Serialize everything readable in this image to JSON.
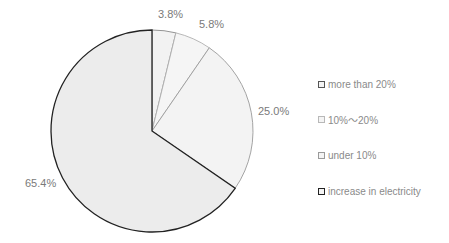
{
  "chart_data": {
    "type": "pie",
    "title": "",
    "start_angle": "12 o'clock",
    "direction": "clockwise",
    "categories": [
      "more than 20%",
      "10%~20%",
      "under 10%",
      "increase in electricity"
    ],
    "values": [
      3.8,
      5.8,
      25.0,
      65.4
    ],
    "data_labels": [
      "3.8%",
      "5.8%",
      "25.0%",
      "65.4%"
    ],
    "legend_position": "right",
    "slice_fill": [
      "#f2f2f2",
      "#f5f5f5",
      "#f3f3f3",
      "#ececec"
    ],
    "slice_stroke": [
      "#888888",
      "#b0b0b0",
      "#9a9a9a",
      "#222222"
    ]
  },
  "legend": [
    {
      "label": "more than 20%",
      "stroke": "#555555"
    },
    {
      "label": "10%～20%",
      "stroke": "#b8b8b8"
    },
    {
      "label": "under 10%",
      "stroke": "#9a9a9a"
    },
    {
      "label": "increase in electricity",
      "stroke": "#222222"
    }
  ]
}
